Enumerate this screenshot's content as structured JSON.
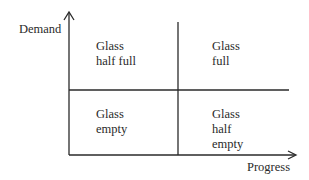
{
  "diagram": {
    "type": "2x2 matrix",
    "y_axis_label": "Demand",
    "x_axis_label": "Progress",
    "quadrants": {
      "top_left": "Glass\nhalf full",
      "top_right": "Glass\nfull",
      "bottom_left": "Glass\nempty",
      "bottom_right": "Glass\nhalf\nempty"
    },
    "colors": {
      "line": "#2a2a2a",
      "text": "#2a2a2a",
      "background": "#ffffff"
    }
  }
}
